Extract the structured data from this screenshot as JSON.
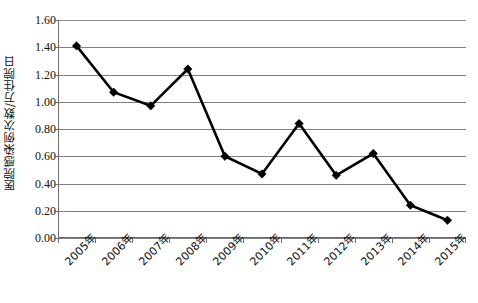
{
  "chart_data": {
    "type": "line",
    "title": "",
    "subtitle": "",
    "xlabel": "",
    "ylabel": "医院感染例次数/万住院日",
    "categories": [
      "2005年",
      "2006年",
      "2007年",
      "2008年",
      "2009年",
      "2010年",
      "2011年",
      "2012年",
      "2013年",
      "2014年",
      "2015年"
    ],
    "values": [
      1.41,
      1.07,
      0.97,
      1.24,
      0.6,
      0.47,
      0.84,
      0.46,
      0.62,
      0.24,
      0.13
    ],
    "series": [
      {
        "name": "医院感染例次数/万住院日",
        "values": [
          1.41,
          1.07,
          0.97,
          1.24,
          0.6,
          0.47,
          0.84,
          0.46,
          0.62,
          0.24,
          0.13
        ]
      }
    ],
    "ylim": [
      0.0,
      1.6
    ],
    "ytick_values": [
      0.0,
      0.2,
      0.4,
      0.6,
      0.8,
      1.0,
      1.2,
      1.4,
      1.6
    ],
    "ytick_labels": [
      "0.00",
      "0.20",
      "0.40",
      "0.60",
      "0.80",
      "1.00",
      "1.20",
      "1.40",
      "1.60"
    ],
    "grid": true,
    "grid_axis": "y",
    "legend": false,
    "legend_position": "none",
    "marker": "diamond",
    "line_color": "#000000",
    "marker_color": "#000000",
    "grid_color": "#808080",
    "axis_color": "#6b6b6b",
    "background_color": "#ffffff",
    "xlabel_rotation": -45
  }
}
